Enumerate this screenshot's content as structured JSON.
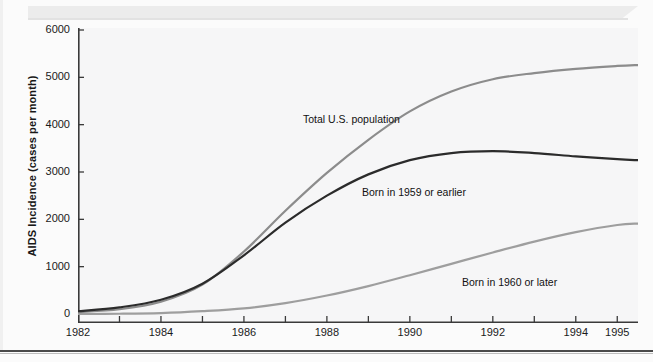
{
  "figure": {
    "background_color": "#fbfbfb",
    "plot_background_color": "#f6f6f7",
    "axis_color": "#333333"
  },
  "axes": {
    "y_title": "AIDS Incidence (cases per month)",
    "y_ticks": [
      "0",
      "1000",
      "2000",
      "3000",
      "4000",
      "5000",
      "6000"
    ],
    "x_ticks": [
      "1982",
      "1984",
      "1986",
      "1988",
      "1990",
      "1992",
      "1994",
      "1995"
    ]
  },
  "annotations": {
    "total": "Total U.S. population",
    "older": "Born in 1959 or earlier",
    "younger": "Born in 1960 or later"
  },
  "chart_data": {
    "type": "line",
    "title": "",
    "xlabel": "",
    "ylabel": "AIDS Incidence (cases per month)",
    "xlim": [
      1982,
      1995.5
    ],
    "ylim": [
      0,
      6000
    ],
    "grid": false,
    "legend_position": "inline-annotations",
    "x_tick_labels": [
      "1982",
      "1984",
      "1986",
      "1988",
      "1990",
      "1992",
      "1994",
      "1995"
    ],
    "x_tick_values": [
      1982,
      1984,
      1986,
      1988,
      1990,
      1992,
      1994,
      1995
    ],
    "y_tick_values": [
      0,
      1000,
      2000,
      3000,
      4000,
      5000,
      6000
    ],
    "x": [
      1982,
      1983,
      1984,
      1985,
      1986,
      1987,
      1988,
      1989,
      1990,
      1991,
      1992,
      1993,
      1994,
      1995,
      1995.5
    ],
    "series": [
      {
        "name": "Total U.S. population",
        "color": "#8c8c8c",
        "label_text": "Total U.S. population",
        "values": [
          40,
          100,
          260,
          620,
          1320,
          2180,
          2980,
          3680,
          4280,
          4700,
          4960,
          5090,
          5180,
          5240,
          5260
        ]
      },
      {
        "name": "Born in 1959 or earlier",
        "color": "#2b2b2b",
        "label_text": "Born in 1959 or earlier",
        "values": [
          60,
          140,
          300,
          640,
          1240,
          1930,
          2500,
          2950,
          3250,
          3400,
          3440,
          3400,
          3330,
          3270,
          3250
        ]
      },
      {
        "name": "Born in 1960 or later",
        "color": "#9e9e9e",
        "label_text": "Born in 1960 or later",
        "values": [
          0,
          5,
          20,
          60,
          120,
          230,
          390,
          590,
          820,
          1060,
          1300,
          1530,
          1730,
          1880,
          1910
        ]
      }
    ]
  }
}
